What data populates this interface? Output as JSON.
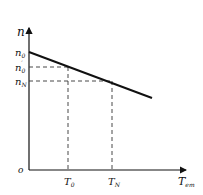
{
  "diagram": {
    "type": "motor mechanical characteristic (speed vs torque)",
    "y_axis_label": "n",
    "x_axis_label": "T",
    "x_axis_label_sub": "em",
    "origin_label": "o",
    "y_ticks": [
      {
        "main": "n",
        "sub": "0",
        "prime": ""
      },
      {
        "main": "n",
        "sub": "0",
        "prime": "′"
      },
      {
        "main": "n",
        "sub": "N",
        "prime": ""
      }
    ],
    "x_ticks": [
      {
        "main": "T",
        "sub": "0"
      },
      {
        "main": "T",
        "sub": "N"
      }
    ],
    "colors": {
      "line": "#111111",
      "dashed": "#333333"
    }
  }
}
